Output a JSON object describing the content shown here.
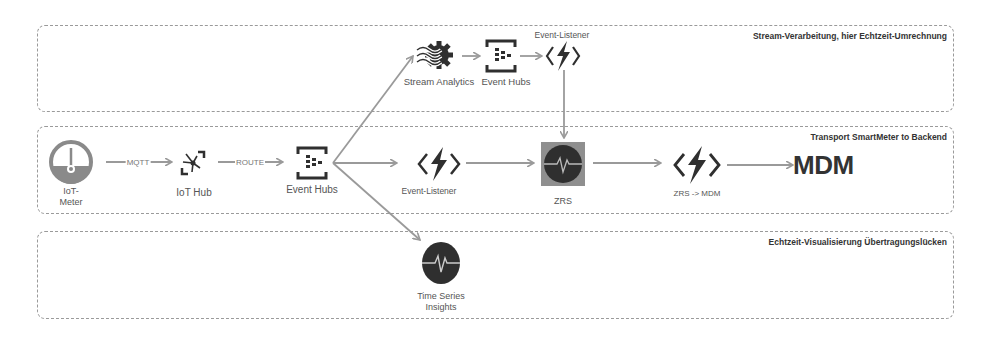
{
  "zones": [
    {
      "id": "stream",
      "title": "Stream-Verarbeitung, hier Echtzeit-Umrechnung"
    },
    {
      "id": "transport",
      "title": "Transport SmartMeter to Backend"
    },
    {
      "id": "visual",
      "title": "Echtzeit-Visualisierung Übertragungslücken"
    }
  ],
  "nodes": {
    "iot_meter": "IoT-\nMeter",
    "iot_meter_l1": "IoT-",
    "iot_meter_l2": "Meter",
    "iot_hub": "IoT Hub",
    "event_hubs": "Event Hubs",
    "event_listener": "Event-Listener",
    "zrs": "ZRS",
    "zrs_mdm": "ZRS -> MDM",
    "mdm": "MDM",
    "stream_analytics": "Stream Analytics",
    "event_hubs_top": "Event Hubs",
    "event_listener_top": "Event-Listener",
    "tsi_l1": "Time Series",
    "tsi_l2": "Insights"
  },
  "edges": {
    "mqtt": "MQTT",
    "route": "ROUTE"
  },
  "colors": {
    "arrow": "#9a9a9a",
    "icon_dark": "#2f2f2f",
    "icon_gray": "#8a8a8a",
    "border": "#9a9a9a"
  }
}
